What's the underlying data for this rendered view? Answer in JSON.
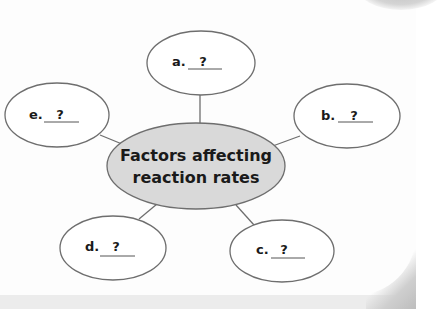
{
  "diagram": {
    "type": "concept-map",
    "center": {
      "line1": "Factors affecting",
      "line2": "reaction rates",
      "fill": "#d9d9d9"
    },
    "nodes": [
      {
        "id": "a",
        "letter": "a.",
        "blank": "?"
      },
      {
        "id": "b",
        "letter": "b.",
        "blank": "?"
      },
      {
        "id": "c",
        "letter": "c.",
        "blank": "?"
      },
      {
        "id": "d",
        "letter": "d.",
        "blank": "?"
      },
      {
        "id": "e",
        "letter": "e.",
        "blank": "?"
      }
    ],
    "stroke_color": "#6e6e6e"
  }
}
